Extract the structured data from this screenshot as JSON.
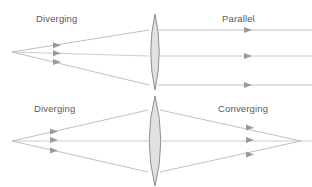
{
  "figure": {
    "width": 312,
    "height": 187,
    "background_color": "#ffffff",
    "ray_color": "#b9b9b9",
    "arrow_color": "#9a9a9a",
    "lens_fill_color": "#dcdcdc",
    "lens_stroke_color": "#8f8f8f",
    "label_color": "#5a5a5a"
  },
  "panels": [
    {
      "id": "upper",
      "name": "diverging-to-parallel",
      "input_label": "Diverging",
      "output_label": "Parallel",
      "input_label_x": 36,
      "input_label_y": 22,
      "output_label_x": 222,
      "output_label_y": 22,
      "source_point": {
        "x": 12,
        "y": 52
      },
      "lens": {
        "center_x": 155,
        "top_y": 14,
        "bottom_y": 90,
        "half_width": 8.5,
        "shape": "biconvex"
      },
      "incoming_rays": [
        {
          "from_y": 52,
          "to_y": 30,
          "arrow_x": 58,
          "arrow_y": 45.2
        },
        {
          "from_y": 52,
          "to_y": 56,
          "arrow_x": 58,
          "arrow_y": 53.2
        },
        {
          "from_y": 52,
          "to_y": 85,
          "arrow_x": 58,
          "arrow_y": 62.1
        }
      ],
      "outgoing_rays": [
        {
          "y": 30,
          "from_x": 157,
          "to_x": 312,
          "arrow_x": 249
        },
        {
          "y": 56,
          "from_x": 157,
          "to_x": 312,
          "arrow_x": 249
        },
        {
          "y": 85,
          "from_x": 157,
          "to_x": 312,
          "arrow_x": 249
        }
      ],
      "outgoing_type": "parallel"
    },
    {
      "id": "lower",
      "name": "diverging-to-converging",
      "input_label": "Diverging",
      "output_label": "Converging",
      "input_label_x": 34,
      "input_label_y": 112,
      "output_label_x": 218,
      "output_label_y": 112,
      "source_point": {
        "x": 12,
        "y": 141
      },
      "focus_point": {
        "x": 301,
        "y": 141
      },
      "lens": {
        "center_x": 155,
        "top_y": 96,
        "bottom_y": 186,
        "half_width": 11.5,
        "shape": "biconvex"
      },
      "incoming_rays": [
        {
          "from_y": 141,
          "to_y": 110,
          "arrow_x": 55,
          "arrow_y": 131.5
        },
        {
          "from_y": 141,
          "to_y": 141,
          "arrow_x": 55,
          "arrow_y": 140.0
        },
        {
          "from_y": 141,
          "to_y": 172,
          "arrow_x": 55,
          "arrow_y": 150.5
        }
      ],
      "outgoing_rays": [
        {
          "from_y": 110,
          "arrow_x": 251,
          "arrow_y": 127.5
        },
        {
          "from_y": 141,
          "arrow_x": 251,
          "arrow_y": 140.0
        },
        {
          "from_y": 172,
          "arrow_x": 251,
          "arrow_y": 154.4
        }
      ],
      "outgoing_type": "converging"
    }
  ]
}
